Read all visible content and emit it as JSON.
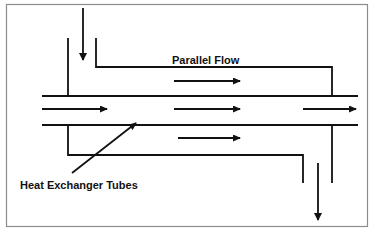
{
  "diagram": {
    "title": "Parallel Flow",
    "tube_label": "Heat Exchanger Tubes",
    "colors": {
      "line": "#111111",
      "frame": "#8c8c8c",
      "background": "#ffffff"
    },
    "frame": {
      "x": 6,
      "y": 4,
      "width": 361,
      "height": 222
    },
    "tubes": {
      "x_start": 42,
      "x_end": 358,
      "top_y": 96,
      "bottom_y": 125
    },
    "shell_inlet": {
      "direction": "down",
      "x": 83,
      "y1": 8,
      "y2": 60
    },
    "shell_outlet": {
      "direction": "down",
      "x": 318,
      "y1": 163,
      "y2": 220
    },
    "flow_arrows": [
      {
        "region": "upper-shell",
        "x1": 174,
        "x2": 240,
        "y": 81,
        "direction": "right"
      },
      {
        "region": "tube",
        "x1": 42,
        "x2": 107,
        "y": 109,
        "direction": "right"
      },
      {
        "region": "tube",
        "x1": 174,
        "x2": 240,
        "y": 109,
        "direction": "right"
      },
      {
        "region": "tube",
        "x1": 303,
        "x2": 356,
        "y": 109,
        "direction": "right"
      },
      {
        "region": "lower-shell",
        "x1": 178,
        "x2": 240,
        "y": 138,
        "direction": "right"
      }
    ]
  }
}
